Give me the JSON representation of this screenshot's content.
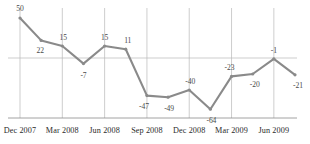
{
  "chart_data": {
    "type": "line",
    "title": "",
    "subtitle": "",
    "xlabel": "",
    "ylabel": "",
    "grid": true,
    "legend_position": "none",
    "zero_line": 0,
    "ylim": [
      -75,
      60
    ],
    "xlim": [
      0,
      13
    ],
    "series": [
      {
        "name": "series-1",
        "values": [
          50,
          22,
          15,
          -7,
          15,
          11,
          -47,
          -49,
          -40,
          -64,
          -23,
          -20,
          -1,
          -21
        ]
      }
    ],
    "point_labels": [
      "50",
      "22",
      "15",
      "-7",
      "15",
      "11",
      "-47",
      "-49",
      "-40",
      "-64",
      "-23",
      "-20",
      "-1",
      "-21"
    ],
    "x_tick_labels": [
      "Dec 2007",
      "Mar 2008",
      "Jun 2008",
      "Sep 2008",
      "Dec 2008",
      "Mar 2009",
      "Jun 2009"
    ],
    "x_tick_positions": [
      0,
      2,
      4,
      6,
      8,
      10,
      12
    ],
    "y_tick_labels": [],
    "colors": {
      "line": "#8a8a8a",
      "grid": "#b8b8b8",
      "axis": "#8a8a8a",
      "label_text": "#4a4a4a",
      "tick_text": "#2b2b2b",
      "background": "#ffffff"
    },
    "label_offsets": [
      {
        "dx": 0,
        "dy": -9
      },
      {
        "dx": -1,
        "dy": 11
      },
      {
        "dx": 1,
        "dy": -8
      },
      {
        "dx": 0,
        "dy": 12
      },
      {
        "dx": 0,
        "dy": -8
      },
      {
        "dx": 2,
        "dy": -8
      },
      {
        "dx": -3,
        "dy": 11
      },
      {
        "dx": 1,
        "dy": 12
      },
      {
        "dx": 1,
        "dy": -8
      },
      {
        "dx": 1,
        "dy": 12
      },
      {
        "dx": -2,
        "dy": -8
      },
      {
        "dx": 2,
        "dy": 11
      },
      {
        "dx": 0,
        "dy": -8
      },
      {
        "dx": 3,
        "dy": 11
      }
    ]
  }
}
